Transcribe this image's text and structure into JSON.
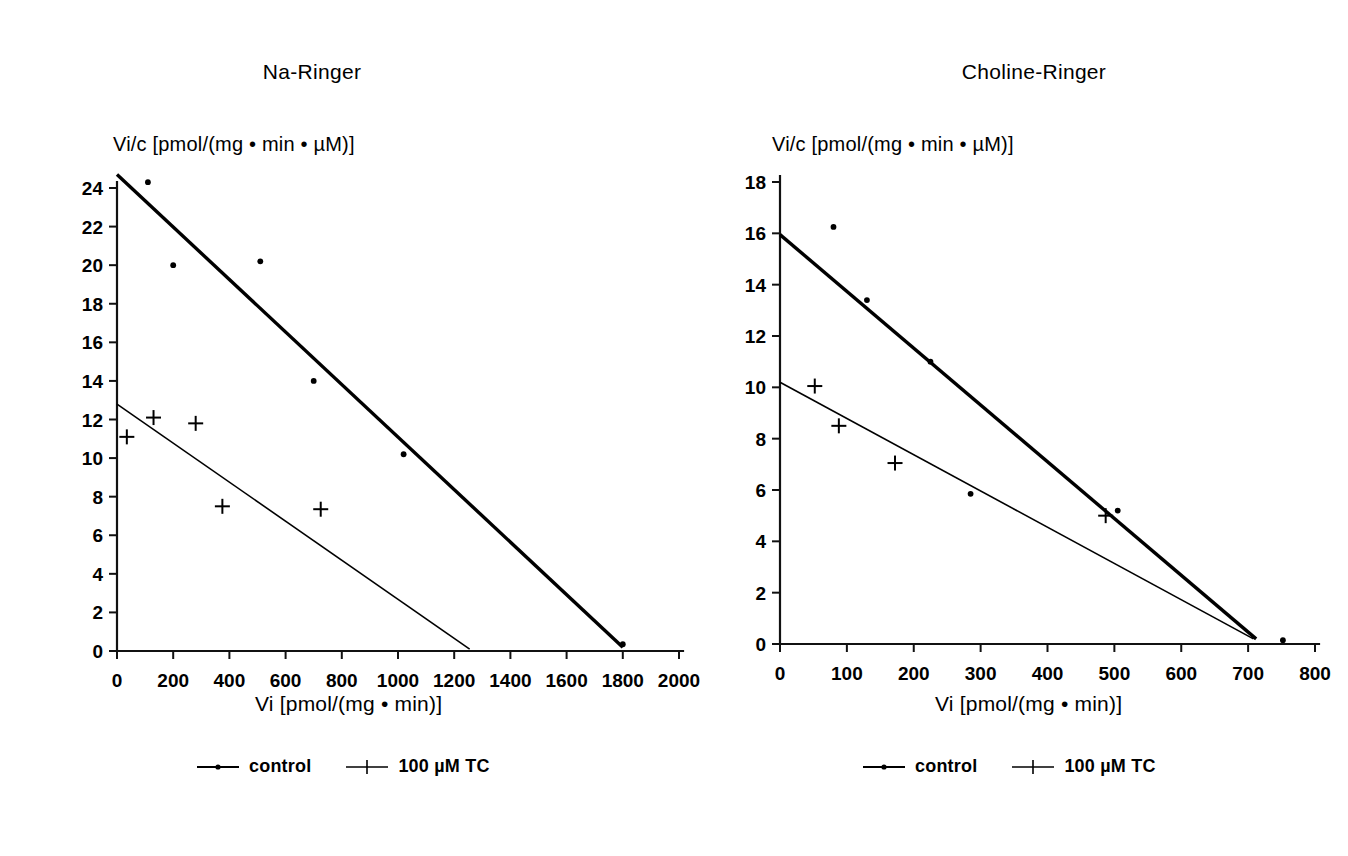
{
  "figure": {
    "background": "#ffffff",
    "ink": "#000000"
  },
  "panels": [
    {
      "key": "na_ringer",
      "title": "Na-Ringer",
      "ylabel": "Vi/c [pmol/(mg • min • µM)]",
      "xlabel": "Vi [pmol/(mg • min)]",
      "legend": [
        {
          "marker": "line-dot",
          "label": "control"
        },
        {
          "marker": "line-plus",
          "label": "100 µM TC"
        }
      ]
    },
    {
      "key": "choline_ringer",
      "title": "Choline-Ringer",
      "ylabel": "Vi/c [pmol/(mg • min • µM)]",
      "xlabel": "Vi [pmol/(mg • min)]",
      "legend": [
        {
          "marker": "line-dot",
          "label": "control"
        },
        {
          "marker": "line-plus",
          "label": "100 µM TC"
        }
      ]
    }
  ],
  "chart_data": [
    {
      "type": "scatter",
      "title": "Na-Ringer",
      "xlabel": "Vi [pmol/(mg • min)]",
      "ylabel": "Vi/c [pmol/(mg • min • µM)]",
      "xlim": [
        0,
        2000
      ],
      "ylim": [
        0,
        24
      ],
      "xticks": [
        0,
        200,
        400,
        600,
        800,
        1000,
        1200,
        1400,
        1600,
        1800,
        2000
      ],
      "yticks": [
        0,
        2,
        4,
        6,
        8,
        10,
        12,
        14,
        16,
        18,
        20,
        22,
        24
      ],
      "grid": false,
      "legend_position": "bottom",
      "series": [
        {
          "name": "control",
          "marker": "dot",
          "points": [
            [
              110,
              24.3
            ],
            [
              200,
              20.0
            ],
            [
              510,
              20.2
            ],
            [
              700,
              14.0
            ],
            [
              1020,
              10.2
            ],
            [
              1800,
              0.35
            ]
          ],
          "fit_line": {
            "x0": 0,
            "y0": 24.7,
            "x1": 1800,
            "y1": 0.2
          }
        },
        {
          "name": "100 µM TC",
          "marker": "plus",
          "points": [
            [
              35,
              11.1
            ],
            [
              130,
              12.1
            ],
            [
              280,
              11.8
            ],
            [
              375,
              7.5
            ],
            [
              725,
              7.35
            ]
          ],
          "fit_line": {
            "x0": 0,
            "y0": 12.8,
            "x1": 1255,
            "y1": 0.1
          }
        }
      ]
    },
    {
      "type": "scatter",
      "title": "Choline-Ringer",
      "xlabel": "Vi [pmol/(mg • min)]",
      "ylabel": "Vi/c [pmol/(mg • min • µM)]",
      "xlim": [
        0,
        800
      ],
      "ylim": [
        0,
        18
      ],
      "xticks": [
        0,
        100,
        200,
        300,
        400,
        500,
        600,
        700,
        800
      ],
      "yticks": [
        0,
        2,
        4,
        6,
        8,
        10,
        12,
        14,
        16,
        18
      ],
      "grid": false,
      "legend_position": "bottom",
      "series": [
        {
          "name": "control",
          "marker": "dot",
          "points": [
            [
              80,
              16.25
            ],
            [
              130,
              13.4
            ],
            [
              225,
              11.0
            ],
            [
              285,
              5.85
            ],
            [
              505,
              5.2
            ],
            [
              752,
              0.15
            ]
          ],
          "fit_line": {
            "x0": 0,
            "y0": 15.95,
            "x1": 712,
            "y1": 0.2
          }
        },
        {
          "name": "100 µM TC",
          "marker": "plus",
          "points": [
            [
              52,
              10.05
            ],
            [
              88,
              8.5
            ],
            [
              172,
              7.05
            ],
            [
              487,
              5.0
            ]
          ],
          "fit_line": {
            "x0": 0,
            "y0": 10.2,
            "x1": 708,
            "y1": 0.2
          }
        }
      ]
    }
  ]
}
